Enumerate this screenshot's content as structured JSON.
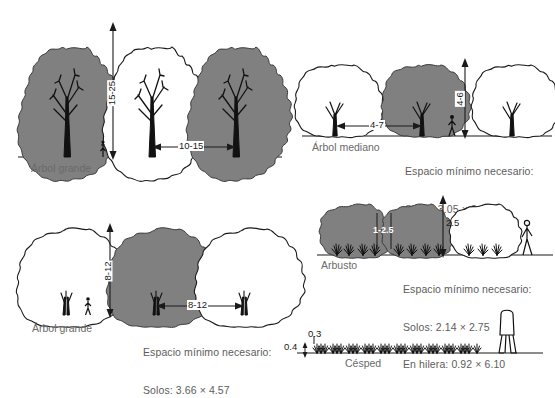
{
  "figure": {
    "line_color": "#1a1a1a",
    "fill_gray": "#808080",
    "caption_color": "#5d5d5d",
    "background": "#ffffff"
  },
  "panels": {
    "large_tree_elevation": {
      "name": "Arbol grande",
      "label": "Árbol grande",
      "height_dim": "15-25",
      "spacing_dim": "10-15"
    },
    "medium_tree_elevation": {
      "name": "Arbol mediano",
      "label": "Árbol mediano",
      "spacing_dim": "4-7",
      "height_dim": "4-6",
      "caption_line1": "Espacio mínimo necesario:",
      "caption_line2": "Solos: 3.05 × 3.66",
      "caption_line3": "En hilera: 1.22 × 9.15"
    },
    "large_tree_plan": {
      "name": "Arbol grande",
      "label": "Árbol grande",
      "height_dim": "8-12",
      "spacing_dim": "8-12",
      "caption_line1": "Espacio mínimo necesario:",
      "caption_line2": "Solos: 3.66 × 4.57"
    },
    "shrub": {
      "name": "Arbusto",
      "label": "Arbusto",
      "spacing_dim": "1-2.5",
      "height_dim": "2.5",
      "caption_line1": "Espacio mínimo necesario:",
      "caption_line2": "Solos: 2.14 × 2.75",
      "caption_line3": "En hilera: 0.92 × 6.10"
    },
    "lawn": {
      "name": "Cesped",
      "label": "Césped",
      "height_dim": "0.3",
      "depth_dim": "0.4"
    }
  }
}
